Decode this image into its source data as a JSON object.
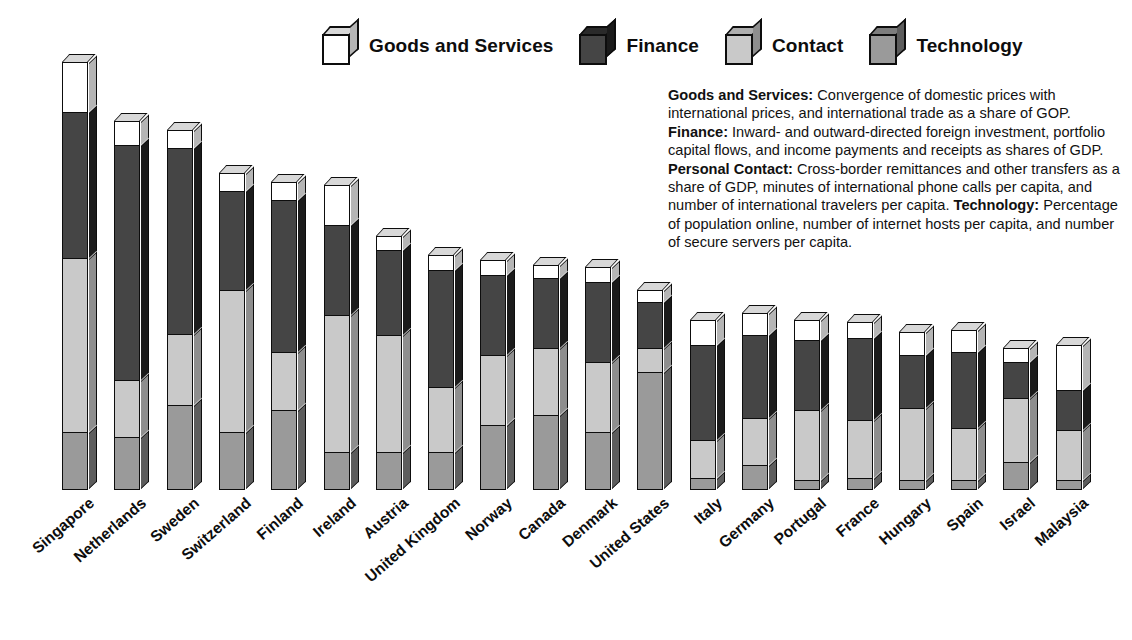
{
  "legend": {
    "items": [
      {
        "label": "Goods and Services",
        "key": "goods",
        "icon": "cube-icon",
        "color": "#ffffff"
      },
      {
        "label": "Finance",
        "key": "finance",
        "icon": "cube-icon",
        "color": "#454545"
      },
      {
        "label": "Contact",
        "key": "contact",
        "icon": "cube-icon",
        "color": "#c9c9c9"
      },
      {
        "label": "Technology",
        "key": "tech",
        "icon": "cube-icon",
        "color": "#9a9a9a"
      }
    ]
  },
  "description": {
    "goods_term": "Goods and Services:",
    "goods_text": " Convergence of domestic prices with international prices, and international trade as a share of GOP. ",
    "finance_term": "Finance:",
    "finance_text": " Inward- and outward-directed foreign investment, portfolio capital flows, and income payments and receipts as shares of GDP. ",
    "contact_term": "Personal Contact:",
    "contact_text": " Cross-border remittances and other transfers as a share of GDP, minutes of international phone calls per capita, and number of international travelers per capita. ",
    "tech_term": "Technology:",
    "tech_text": " Percentage of population online, number of internet hosts per capita, and number of secure servers per capita."
  },
  "chart_data": {
    "type": "bar",
    "subtype": "stacked-vertical-3d",
    "title": "",
    "xlabel": "",
    "ylabel": "",
    "grid": false,
    "legend_position": "top",
    "stack_order_bottom_to_top": [
      "Technology",
      "Contact",
      "Finance",
      "Goods and Services"
    ],
    "ylim": [
      0,
      100
    ],
    "categories": [
      "Singapore",
      "Netherlands",
      "Sweden",
      "Switzerland",
      "Finland",
      "Ireland",
      "Austria",
      "United Kingdom",
      "Norway",
      "Canada",
      "Denmark",
      "United States",
      "Italy",
      "Germany",
      "Portugal",
      "France",
      "Hungary",
      "Spain",
      "Israel",
      "Malaysia"
    ],
    "series": [
      {
        "name": "Goods and Services",
        "color": "#ffffff",
        "values": [
          11.7,
          5.6,
          4.2,
          4.2,
          4.2,
          9.3,
          3.3,
          3.5,
          3.5,
          3.0,
          3.5,
          2.8,
          5.8,
          5.1,
          4.7,
          3.7,
          5.4,
          5.1,
          3.3,
          10.5
        ]
      },
      {
        "name": "Finance",
        "color": "#454545",
        "values": [
          34.1,
          54.9,
          43.5,
          23.1,
          35.5,
          21.0,
          19.9,
          27.3,
          18.7,
          16.4,
          18.7,
          10.7,
          22.2,
          19.4,
          16.4,
          19.2,
          12.4,
          17.8,
          8.4,
          9.3
        ]
      },
      {
        "name": "Contact",
        "color": "#c9c9c9",
        "values": [
          40.7,
          13.3,
          16.6,
          33.2,
          13.6,
          32.0,
          27.3,
          15.2,
          16.4,
          15.7,
          16.4,
          5.6,
          8.9,
          11.0,
          16.4,
          13.6,
          16.8,
          12.1,
          15.0,
          11.7
        ]
      },
      {
        "name": "Technology",
        "color": "#9a9a9a",
        "values": [
          13.5,
          12.4,
          19.9,
          13.5,
          18.7,
          8.9,
          8.9,
          8.9,
          15.2,
          17.5,
          13.6,
          27.6,
          2.8,
          5.8,
          2.3,
          2.8,
          2.3,
          2.3,
          6.5,
          2.3
        ]
      }
    ],
    "totals": [
      100.0,
      86.2,
      84.2,
      74.0,
      72.0,
      71.2,
      59.4,
      54.9,
      53.8,
      52.6,
      52.2,
      46.7,
      39.7,
      41.3,
      39.8,
      39.3,
      36.9,
      37.3,
      33.2,
      33.8
    ]
  }
}
